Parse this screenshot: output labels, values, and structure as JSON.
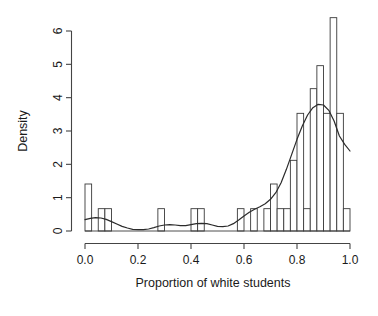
{
  "chart_data": {
    "type": "bar",
    "title": "",
    "subtitle": "",
    "xlabel": "Proportion of white students",
    "ylabel": "Density",
    "xlim": [
      0.0,
      1.0
    ],
    "ylim": [
      0.0,
      6.5
    ],
    "grid": false,
    "legend": null,
    "xticks": [
      0.0,
      0.2,
      0.4,
      0.6,
      0.8,
      1.0
    ],
    "xtick_labels": [
      "0.0",
      "0.2",
      "0.4",
      "0.6",
      "0.8",
      "1.0"
    ],
    "yticks": [
      0,
      1,
      2,
      3,
      4,
      5,
      6
    ],
    "ytick_labels": [
      "0",
      "1",
      "2",
      "3",
      "4",
      "5",
      "6"
    ],
    "bin_width": 0.025,
    "bins": [
      {
        "x0": 0.0,
        "x1": 0.025,
        "density": 1.41
      },
      {
        "x0": 0.025,
        "x1": 0.05,
        "density": 0.0
      },
      {
        "x0": 0.05,
        "x1": 0.075,
        "density": 0.67
      },
      {
        "x0": 0.075,
        "x1": 0.1,
        "density": 0.67
      },
      {
        "x0": 0.1,
        "x1": 0.125,
        "density": 0.0
      },
      {
        "x0": 0.125,
        "x1": 0.15,
        "density": 0.0
      },
      {
        "x0": 0.15,
        "x1": 0.175,
        "density": 0.0
      },
      {
        "x0": 0.175,
        "x1": 0.2,
        "density": 0.0
      },
      {
        "x0": 0.2,
        "x1": 0.225,
        "density": 0.0
      },
      {
        "x0": 0.225,
        "x1": 0.25,
        "density": 0.0
      },
      {
        "x0": 0.25,
        "x1": 0.275,
        "density": 0.0
      },
      {
        "x0": 0.275,
        "x1": 0.3,
        "density": 0.67
      },
      {
        "x0": 0.3,
        "x1": 0.325,
        "density": 0.0
      },
      {
        "x0": 0.325,
        "x1": 0.35,
        "density": 0.0
      },
      {
        "x0": 0.35,
        "x1": 0.375,
        "density": 0.0
      },
      {
        "x0": 0.375,
        "x1": 0.4,
        "density": 0.0
      },
      {
        "x0": 0.4,
        "x1": 0.425,
        "density": 0.67
      },
      {
        "x0": 0.425,
        "x1": 0.45,
        "density": 0.67
      },
      {
        "x0": 0.45,
        "x1": 0.475,
        "density": 0.0
      },
      {
        "x0": 0.475,
        "x1": 0.5,
        "density": 0.0
      },
      {
        "x0": 0.5,
        "x1": 0.525,
        "density": 0.0
      },
      {
        "x0": 0.525,
        "x1": 0.55,
        "density": 0.0
      },
      {
        "x0": 0.55,
        "x1": 0.575,
        "density": 0.0
      },
      {
        "x0": 0.575,
        "x1": 0.6,
        "density": 0.67
      },
      {
        "x0": 0.6,
        "x1": 0.625,
        "density": 0.0
      },
      {
        "x0": 0.625,
        "x1": 0.65,
        "density": 0.67
      },
      {
        "x0": 0.65,
        "x1": 0.675,
        "density": 0.0
      },
      {
        "x0": 0.675,
        "x1": 0.7,
        "density": 0.67
      },
      {
        "x0": 0.7,
        "x1": 0.725,
        "density": 1.41
      },
      {
        "x0": 0.725,
        "x1": 0.75,
        "density": 0.67
      },
      {
        "x0": 0.75,
        "x1": 0.775,
        "density": 0.67
      },
      {
        "x0": 0.775,
        "x1": 0.8,
        "density": 2.12
      },
      {
        "x0": 0.8,
        "x1": 0.825,
        "density": 3.53
      },
      {
        "x0": 0.825,
        "x1": 0.85,
        "density": 0.67
      },
      {
        "x0": 0.85,
        "x1": 0.875,
        "density": 4.27
      },
      {
        "x0": 0.875,
        "x1": 0.9,
        "density": 4.96
      },
      {
        "x0": 0.9,
        "x1": 0.925,
        "density": 3.53
      },
      {
        "x0": 0.925,
        "x1": 0.95,
        "density": 6.4
      },
      {
        "x0": 0.95,
        "x1": 0.975,
        "density": 3.53
      },
      {
        "x0": 0.975,
        "x1": 1.0,
        "density": 0.67
      }
    ],
    "density_curve": {
      "name": "kernel density estimate",
      "x": [
        0.0,
        0.02,
        0.04,
        0.06,
        0.08,
        0.1,
        0.12,
        0.14,
        0.16,
        0.18,
        0.2,
        0.22,
        0.24,
        0.26,
        0.28,
        0.3,
        0.32,
        0.34,
        0.36,
        0.38,
        0.4,
        0.42,
        0.44,
        0.46,
        0.48,
        0.5,
        0.52,
        0.54,
        0.56,
        0.58,
        0.6,
        0.62,
        0.64,
        0.66,
        0.68,
        0.7,
        0.72,
        0.74,
        0.76,
        0.78,
        0.8,
        0.82,
        0.84,
        0.86,
        0.88,
        0.9,
        0.92,
        0.94,
        0.96,
        0.98,
        1.0
      ],
      "y": [
        0.34,
        0.38,
        0.4,
        0.39,
        0.35,
        0.28,
        0.21,
        0.14,
        0.09,
        0.05,
        0.04,
        0.04,
        0.06,
        0.1,
        0.15,
        0.18,
        0.19,
        0.18,
        0.16,
        0.16,
        0.19,
        0.22,
        0.23,
        0.22,
        0.18,
        0.14,
        0.13,
        0.15,
        0.22,
        0.33,
        0.45,
        0.56,
        0.65,
        0.73,
        0.82,
        0.95,
        1.15,
        1.45,
        1.85,
        2.3,
        2.75,
        3.15,
        3.48,
        3.7,
        3.8,
        3.78,
        3.62,
        3.3,
        2.85,
        2.6,
        2.4
      ]
    }
  },
  "axis": {
    "y_label": "Density",
    "x_label": "Proportion of white students"
  }
}
